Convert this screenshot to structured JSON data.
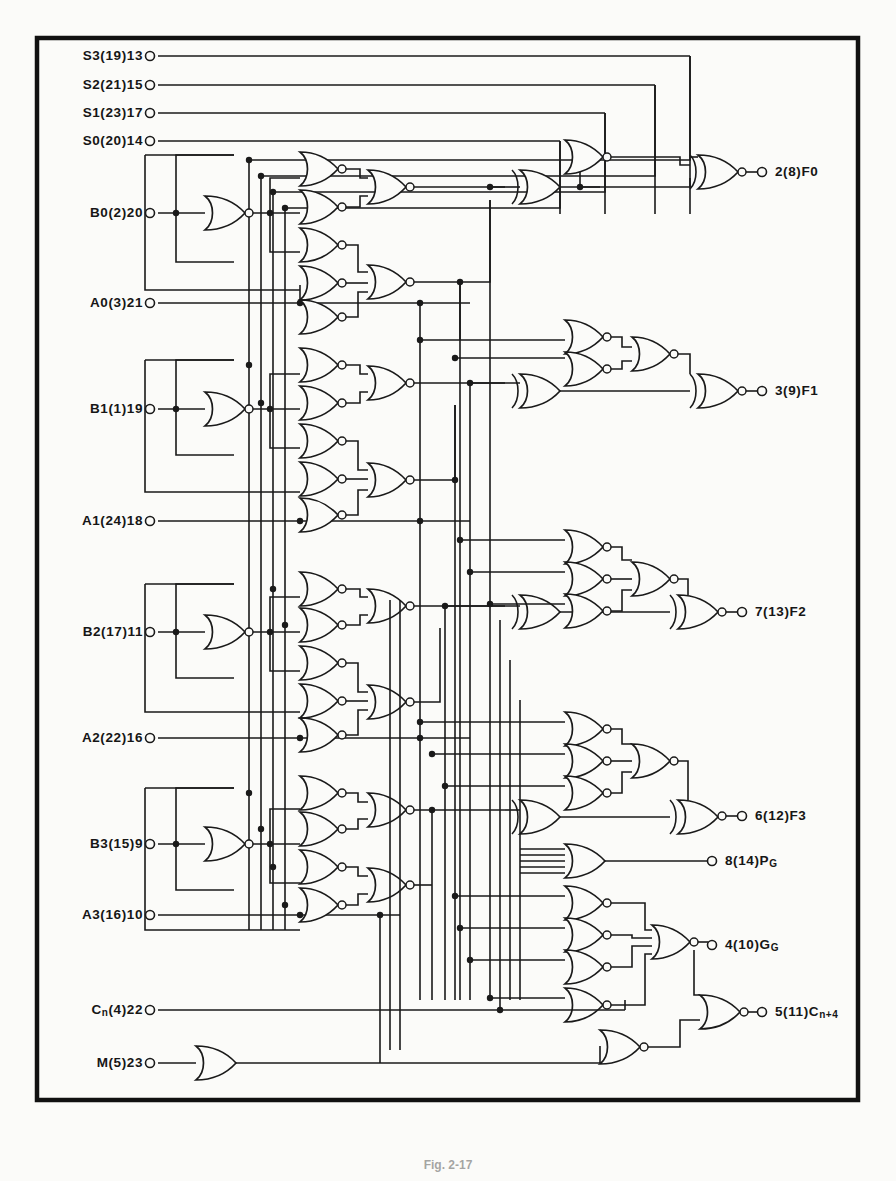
{
  "figure": {
    "caption": "Fig. 2-17",
    "background_color": "#fbfbf9",
    "ink_color": "#1a1a1a",
    "border": {
      "x": 37,
      "y": 38,
      "width": 821,
      "height": 1062,
      "stroke_width": 4.5
    }
  },
  "inputs": [
    {
      "name": "S3",
      "label": "S3(19)13",
      "pin_x": 150,
      "pin_y": 56
    },
    {
      "name": "S2",
      "label": "S2(21)15",
      "pin_x": 150,
      "pin_y": 85
    },
    {
      "name": "S1",
      "label": "S1(23)17",
      "pin_x": 150,
      "pin_y": 113
    },
    {
      "name": "S0",
      "label": "S0(20)14",
      "pin_x": 150,
      "pin_y": 141
    },
    {
      "name": "B0",
      "label": "B0(2)20",
      "pin_x": 150,
      "pin_y": 213
    },
    {
      "name": "A0",
      "label": "A0(3)21",
      "pin_x": 150,
      "pin_y": 303
    },
    {
      "name": "B1",
      "label": "B1(1)19",
      "pin_x": 150,
      "pin_y": 409
    },
    {
      "name": "A1",
      "label": "A1(24)18",
      "pin_x": 150,
      "pin_y": 521
    },
    {
      "name": "B2",
      "label": "B2(17)11",
      "pin_x": 150,
      "pin_y": 632
    },
    {
      "name": "A2",
      "label": "A2(22)16",
      "pin_x": 150,
      "pin_y": 738
    },
    {
      "name": "B3",
      "label": "B3(15)9",
      "pin_x": 150,
      "pin_y": 844
    },
    {
      "name": "A3",
      "label": "A3(16)10",
      "pin_x": 150,
      "pin_y": 915
    },
    {
      "name": "Cn",
      "label": "C",
      "label_sub": "n",
      "label_tail": "(4)22",
      "pin_x": 150,
      "pin_y": 1010
    },
    {
      "name": "M",
      "label": "M(5)23",
      "pin_x": 150,
      "pin_y": 1063
    }
  ],
  "outputs": [
    {
      "name": "F0",
      "label": "2(8)F0",
      "pin_x": 762,
      "pin_y": 172
    },
    {
      "name": "F1",
      "label": "3(9)F1",
      "pin_x": 762,
      "pin_y": 391
    },
    {
      "name": "F2",
      "label": "7(13)F2",
      "pin_x": 742,
      "pin_y": 612
    },
    {
      "name": "F3",
      "label": "6(12)F3",
      "pin_x": 742,
      "pin_y": 816
    },
    {
      "name": "PG",
      "label": "8(14)P",
      "label_sub": "G",
      "pin_x": 712,
      "pin_y": 861
    },
    {
      "name": "GG",
      "label": "4(10)G",
      "label_sub": "G",
      "pin_x": 712,
      "pin_y": 945
    },
    {
      "name": "Cn4",
      "label": "5(11)C",
      "label_sub": "n+4",
      "pin_x": 762,
      "pin_y": 1012
    }
  ],
  "gate_types": [
    "nor",
    "nand",
    "or",
    "xor",
    "buffer"
  ],
  "gate_counts": {
    "input_nor_inverters": 8,
    "nand_nor_array": 40,
    "xor": 6,
    "output_or": 5
  }
}
